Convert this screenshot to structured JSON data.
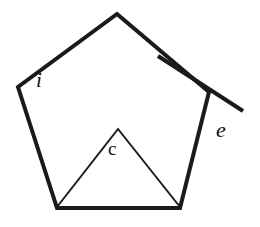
{
  "figure": {
    "background_color": "#ffffff",
    "stroke_color": "#1a1a1a",
    "outer_stroke_width": 4,
    "inner_stroke_width": 2,
    "pentagon": {
      "name": "regular-pentagon",
      "vertices": [
        {
          "name": "apex-top",
          "x": 117,
          "y": 14
        },
        {
          "name": "vertex-right-upper",
          "x": 209,
          "y": 92
        },
        {
          "name": "vertex-bottom-right",
          "x": 180,
          "y": 208
        },
        {
          "name": "vertex-bottom-left",
          "x": 57,
          "y": 208
        },
        {
          "name": "vertex-left-upper",
          "x": 18,
          "y": 87
        }
      ],
      "points_attr": "117,14 209,92 180,208 57,208 18,87"
    },
    "exterior_extension": {
      "name": "exterior-angle-extension-line",
      "from": {
        "x": 158,
        "y": 56
      },
      "to": {
        "x": 243,
        "y": 111
      },
      "x1": 158,
      "y1": 56,
      "x2": 243,
      "y2": 111
    },
    "central_triangle": {
      "name": "central-angle-triangle",
      "apex": {
        "x": 118,
        "y": 129
      },
      "left_base": {
        "x": 57,
        "y": 207
      },
      "right_base": {
        "x": 180,
        "y": 207
      },
      "points_attr": "57,207 118,129 180,207"
    },
    "labels": {
      "interior": {
        "text": "i",
        "style": "italic",
        "x": 36,
        "y": 70
      },
      "exterior": {
        "text": "e",
        "style": "italic",
        "x": 216,
        "y": 119
      },
      "central": {
        "text": "c",
        "style": "upright",
        "x": 108,
        "y": 139
      }
    }
  }
}
